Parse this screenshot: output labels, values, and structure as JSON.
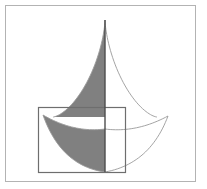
{
  "figure": {
    "title": "Astroid with shaded regions and bounding rectangle",
    "canvas": {
      "width": 207,
      "height": 189
    },
    "colors": {
      "background": "#ffffff",
      "shade_fill": "#808080",
      "curve_stroke": "#9a9a9a",
      "axis_stroke": "#4d4d4d",
      "rectangle_stroke": "#6e6e6e",
      "frame_stroke": "#b3b3b3"
    },
    "frame": {
      "label": "outer-frame",
      "x": 5.5,
      "y": 5.5,
      "width": 190,
      "height": 176,
      "stroke_width": 1
    },
    "center": {
      "x": 105,
      "y": 117
    },
    "astroid": {
      "label": "astroid",
      "radius_x": 52,
      "radius_y": 97,
      "cusp_top": {
        "x": 105,
        "y": 20
      },
      "cusp_left": {
        "x": 53,
        "y": 117
      },
      "cusp_right": {
        "x": 157,
        "y": 117
      },
      "cusp_bottom": {
        "x": 105,
        "y": 214
      },
      "note": "Only the upper half of the astroid is drawn; left upper quadrant is shaded."
    },
    "lower_curve": {
      "label": "lower-crescent",
      "left_tip": {
        "x": 43,
        "y": 115
      },
      "right_tip": {
        "x": 168,
        "y": 116
      },
      "bottom_point": {
        "x": 105,
        "y": 172
      },
      "note": "Lower region bounded above by a shallow arc and below by a deeper arc; left half shaded."
    },
    "rectangle": {
      "label": "bounding-rectangle",
      "x": 38.5,
      "y": 107.5,
      "width": 87,
      "height": 65,
      "stroke_width": 1.2
    },
    "axis_line": {
      "label": "vertical-axis",
      "x": 105,
      "y_top": 20,
      "y_bottom": 172,
      "stroke_width": 1.4
    }
  }
}
